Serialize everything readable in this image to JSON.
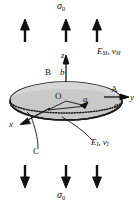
{
  "figure": {
    "colors": {
      "ink": "#111111",
      "spheroid_fill": "#c9c9c9",
      "spheroid_top_fill": "#d8d8d8",
      "outline": "#1a1a1a",
      "background": "#ffffff"
    }
  },
  "labels": {
    "stress_top": "σ",
    "stress_top_sub": "0",
    "stress_bottom": "σ",
    "stress_bottom_sub": "0",
    "matrix_modulus": "E",
    "matrix_modulus_sub": "M",
    "matrix_poisson": "v",
    "matrix_poisson_sub": "M",
    "matrix_separator": ",",
    "inclusion_modulus": "E",
    "inclusion_modulus_sub": "I",
    "inclusion_poisson": "v",
    "inclusion_poisson_sub": "I",
    "inclusion_separator": ",",
    "axis_z": "z",
    "axis_y": "y",
    "axis_x": "x",
    "point_A": "A",
    "point_B": "B",
    "point_C": "C",
    "origin": "O",
    "semi_axis_a_outer": "a",
    "semi_axis_a_inner": "a",
    "semi_axis_b": "b"
  },
  "arrows": {
    "top_count": 3,
    "top_direction": "up",
    "bottom_count": 3,
    "bottom_direction": "down",
    "top_x_positions": [
      25,
      66,
      97
    ],
    "bottom_x_positions": [
      25,
      66,
      97
    ]
  },
  "geometry": {
    "spheroid_center": [
      66,
      101
    ],
    "spheroid_rx": 56,
    "spheroid_ry": 19,
    "equator_dash": "dotted"
  }
}
